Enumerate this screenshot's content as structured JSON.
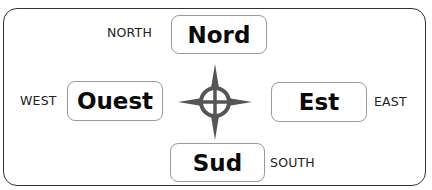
{
  "diagram": {
    "title": "",
    "directions": {
      "north": {
        "french": "Nord",
        "english": "NORTH"
      },
      "west": {
        "french": "Ouest",
        "english": "WEST"
      },
      "east": {
        "french": "Est",
        "english": "EAST"
      },
      "south": {
        "french": "Sud",
        "english": "SOUTH"
      }
    },
    "center_icon": "compass-rose-icon",
    "colors": {
      "compass": "#555555",
      "border": "#333333",
      "box_border": "#9a9a9a"
    }
  }
}
